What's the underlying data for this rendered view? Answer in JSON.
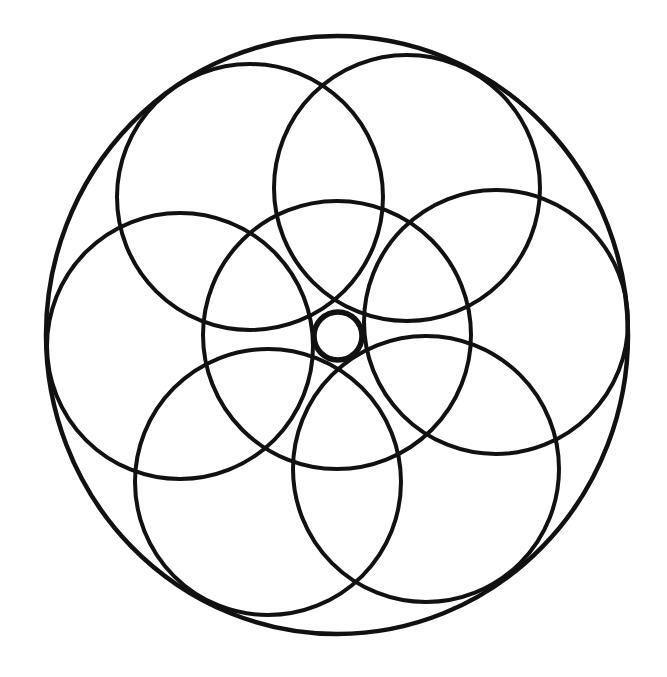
{
  "diagram": {
    "background": "#ffffff",
    "stroke_color": "#111111",
    "outer_circle": {
      "cx": 337,
      "cy": 335,
      "rx": 291,
      "ry": 299,
      "stroke_width": 4.5
    },
    "center_circle": {
      "cx": 337,
      "cy": 335,
      "r": 134,
      "stroke_width": 4
    },
    "petal_circles": [
      {
        "name": "upper-left",
        "cx": 250,
        "cy": 197,
        "r": 133
      },
      {
        "name": "upper-right",
        "cx": 407,
        "cy": 188,
        "r": 133
      },
      {
        "name": "right",
        "cx": 496,
        "cy": 322,
        "r": 132
      },
      {
        "name": "bottom-right",
        "cx": 426,
        "cy": 469,
        "r": 133
      },
      {
        "name": "bottom-left",
        "cx": 268,
        "cy": 482,
        "r": 133
      },
      {
        "name": "left",
        "cx": 180,
        "cy": 346,
        "r": 133
      }
    ],
    "petal_stroke_width": 4,
    "inner_small_circle": {
      "cx": 338,
      "cy": 336,
      "r": 24,
      "stroke_width": 5.5
    }
  }
}
